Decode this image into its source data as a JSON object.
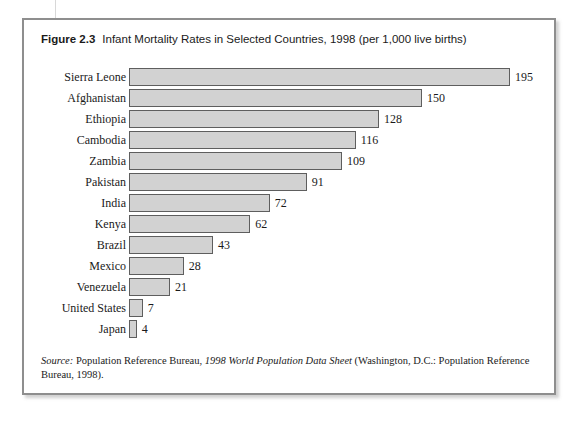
{
  "figure": {
    "number": "Figure 2.3",
    "title": "Infant Mortality Rates in Selected Countries, 1998 (per 1,000 live births)"
  },
  "source": {
    "word": "Source:",
    "publisher": " Population Reference Bureau, ",
    "title": "1998 World Population Data Sheet",
    "rest": " (Washington, D.C.: Population Reference Bureau, 1998)."
  },
  "colors": {
    "bar_fill": "#d2d2d2",
    "bar_border": "#5e5e5e",
    "frame_border": "#8e8e8e",
    "text": "#1a1a1a"
  },
  "chart_data": {
    "type": "bar",
    "orientation": "horizontal",
    "title": "Infant Mortality Rates in Selected Countries, 1998 (per 1,000 live births)",
    "xlabel": "",
    "ylabel": "",
    "xlim": [
      0,
      195
    ],
    "grid": false,
    "legend": false,
    "data_labels": true,
    "categories": [
      "Sierra Leone",
      "Afghanistan",
      "Ethiopia",
      "Cambodia",
      "Zambia",
      "Pakistan",
      "India",
      "Kenya",
      "Brazil",
      "Mexico",
      "Venezuela",
      "United States",
      "Japan"
    ],
    "values": [
      195,
      150,
      128,
      116,
      109,
      91,
      72,
      62,
      43,
      28,
      21,
      7,
      4
    ]
  }
}
